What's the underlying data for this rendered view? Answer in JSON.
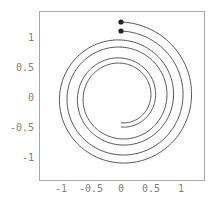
{
  "chart_data": {
    "type": "line",
    "title": "",
    "xlabel": "",
    "ylabel": "",
    "xlim": [
      -1.35,
      1.45
    ],
    "ylim": [
      -1.4,
      1.45
    ],
    "grid": false,
    "x_ticks": [
      {
        "value": -1,
        "label": "-1"
      },
      {
        "value": -0.5,
        "label": "-0.5"
      },
      {
        "value": 0,
        "label": "0"
      },
      {
        "value": 0.5,
        "label": "0.5"
      },
      {
        "value": 1,
        "label": "1"
      }
    ],
    "y_ticks": [
      {
        "value": 1,
        "label": "1"
      },
      {
        "value": 0.5,
        "label": "0.5"
      },
      {
        "value": 0,
        "label": "0"
      },
      {
        "value": -0.5,
        "label": "-0.5"
      },
      {
        "value": -1,
        "label": "-1"
      }
    ],
    "series": [
      {
        "name": "outer-spiral",
        "start": {
          "x": 0,
          "y": 1.25
        },
        "end": {
          "x": 0,
          "y": -0.5
        },
        "start_radius": 1.25,
        "end_radius": 0.5,
        "turns": 2.5,
        "direction": "clockwise",
        "start_marker": true
      },
      {
        "name": "inner-spiral",
        "start": {
          "x": 0,
          "y": 1.1
        },
        "end": {
          "x": 0,
          "y": -0.43
        },
        "start_radius": 1.1,
        "end_radius": 0.43,
        "turns": 2.5,
        "direction": "clockwise",
        "start_marker": true
      }
    ],
    "colors": {
      "curve": "#555555",
      "marker": "#222222",
      "frame": "#a8a8a8",
      "tick_text": "#808080"
    }
  }
}
